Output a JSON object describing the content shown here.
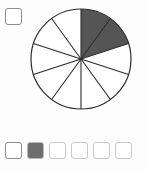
{
  "widget": {
    "name": "fraction-pie-question",
    "background_color": "#fdfdfd"
  },
  "top_checkbox": {
    "name": "question-checkbox",
    "checked": false,
    "label": "",
    "border_color": "#8e8e8e",
    "fill_color": "#ffffff"
  },
  "pie": {
    "total_sectors": 10,
    "shaded_sectors": 2,
    "unshaded_sectors": 8,
    "fraction_label": "2/10",
    "start_angle_deg": 0,
    "sector_angle_deg": 36,
    "shaded_span_deg": 72,
    "direction": "clockwise",
    "shaded_color": "#555555",
    "unshaded_color": "#ffffff",
    "outline_color": "#2b2b2b",
    "outline_width": 1.2,
    "spoke_color": "#2b2b2b",
    "spoke_width": 1.1,
    "center_x": 52,
    "center_y": 52,
    "radius": 50
  },
  "answer_row": {
    "name": "answer-options",
    "options": [
      {
        "id": "option-1",
        "state": "empty",
        "fill": "#ffffff",
        "border": "#8e8e8e"
      },
      {
        "id": "option-2",
        "state": "filled",
        "fill": "#6e6e6e",
        "border": "#b9b9b9"
      },
      {
        "id": "option-3",
        "state": "empty",
        "fill": "#ffffff",
        "border": "#c9c9c9"
      },
      {
        "id": "option-4",
        "state": "empty",
        "fill": "#ffffff",
        "border": "#c9c9c9"
      },
      {
        "id": "option-5",
        "state": "empty",
        "fill": "#ffffff",
        "border": "#c9c9c9"
      },
      {
        "id": "option-6",
        "state": "empty",
        "fill": "#ffffff",
        "border": "#c9c9c9"
      }
    ]
  },
  "chart_data": {
    "type": "pie",
    "title": "",
    "xlabel": "",
    "ylabel": "",
    "categories": [
      "shaded",
      "unshaded"
    ],
    "values": [
      2,
      8
    ],
    "slice_count": 10,
    "slice_values": [
      1,
      1,
      1,
      1,
      1,
      1,
      1,
      1,
      1,
      1
    ],
    "slice_states": [
      "shaded",
      "shaded",
      "unshaded",
      "unshaded",
      "unshaded",
      "unshaded",
      "unshaded",
      "unshaded",
      "unshaded",
      "unshaded"
    ],
    "slice_colors": [
      "#555555",
      "#555555",
      "#ffffff",
      "#ffffff",
      "#ffffff",
      "#ffffff",
      "#ffffff",
      "#ffffff",
      "#ffffff",
      "#ffffff"
    ],
    "each_slice_degrees": 36,
    "legend": [],
    "grid": false,
    "legend_position": "none",
    "annotations": []
  }
}
